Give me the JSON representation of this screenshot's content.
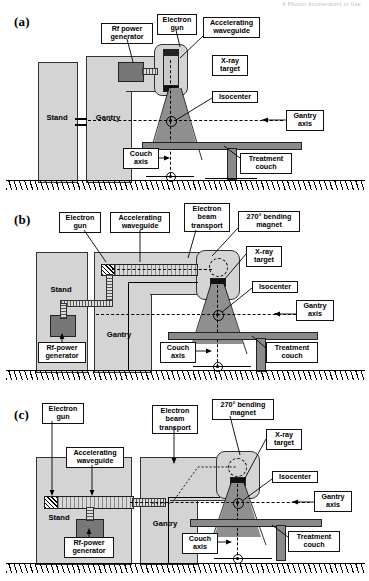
{
  "figure": {
    "type": "technical-diagram",
    "panel_count": 3,
    "header_faint_text": "4  Photon Accelerators in Use"
  },
  "panels": [
    {
      "id": "a",
      "label": "(a)",
      "description": "Straight-through beam linac: short accelerating waveguide mounted vertically in the gantry head, x-ray target at waveguide exit, no bending magnet.",
      "callouts": [
        {
          "name": "rf-power-generator",
          "text": "Rf power\ngenerator"
        },
        {
          "name": "electron-gun",
          "text": "Electron\ngun"
        },
        {
          "name": "accelerating-waveguide",
          "text": "Accelerating\nwaveguide"
        },
        {
          "name": "x-ray-target",
          "text": "X-ray\ntarget"
        },
        {
          "name": "isocenter",
          "text": "Isocenter"
        },
        {
          "name": "gantry-axis",
          "text": "Gantry\naxis"
        },
        {
          "name": "couch-axis",
          "text": "Couch\naxis"
        },
        {
          "name": "treatment-couch",
          "text": "Treatment\ncouch"
        }
      ],
      "body_labels": [
        {
          "name": "stand",
          "text": "Stand"
        },
        {
          "name": "gantry",
          "text": "Gantry"
        }
      ]
    },
    {
      "id": "b",
      "label": "(b)",
      "description": "Horizontal accelerating waveguide in the gantry with 270 degree bending magnet directing the electron beam onto the x-ray target; rf-power generator in the stand.",
      "callouts": [
        {
          "name": "electron-gun",
          "text": "Electron\ngun"
        },
        {
          "name": "accelerating-waveguide",
          "text": "Accelerating\nwaveguide"
        },
        {
          "name": "electron-beam-transport",
          "text": "Electron\nbeam\ntransport"
        },
        {
          "name": "bending-magnet",
          "text": "270° bending\nmagnet"
        },
        {
          "name": "x-ray-target",
          "text": "X-ray\ntarget"
        },
        {
          "name": "isocenter",
          "text": "Isocenter"
        },
        {
          "name": "gantry-axis",
          "text": "Gantry\naxis"
        },
        {
          "name": "couch-axis",
          "text": "Couch\naxis"
        },
        {
          "name": "treatment-couch",
          "text": "Treatment\ncouch"
        },
        {
          "name": "rf-power-generator",
          "text": "Rf-power\ngenerator"
        }
      ],
      "body_labels": [
        {
          "name": "stand",
          "text": "Stand"
        },
        {
          "name": "gantry",
          "text": "Gantry"
        }
      ]
    },
    {
      "id": "c",
      "label": "(c)",
      "description": "Long accelerating waveguide mounted horizontally in the stand, electron beam transport carries beam into the gantry to a 270 degree bending magnet and the x-ray target.",
      "callouts": [
        {
          "name": "electron-gun",
          "text": "Electron\ngun"
        },
        {
          "name": "accelerating-waveguide",
          "text": "Accelerating\nwaveguide"
        },
        {
          "name": "electron-beam-transport",
          "text": "Electron\nbeam\ntransport"
        },
        {
          "name": "bending-magnet",
          "text": "270° bending\nmagnet"
        },
        {
          "name": "x-ray-target",
          "text": "X-ray\ntarget"
        },
        {
          "name": "isocenter",
          "text": "Isocenter"
        },
        {
          "name": "gantry-axis",
          "text": "Gantry\naxis"
        },
        {
          "name": "couch-axis",
          "text": "Couch\naxis"
        },
        {
          "name": "treatment-couch",
          "text": "Treatment\ncouch"
        },
        {
          "name": "rf-power-generator",
          "text": "Rf-power\ngenerator"
        }
      ],
      "body_labels": [
        {
          "name": "stand",
          "text": "Stand"
        },
        {
          "name": "gantry",
          "text": "Gantry"
        }
      ]
    }
  ],
  "colors": {
    "body_fill": "#d4d4d4",
    "beam_fill": "#8f8f8f",
    "solid_component": "#777777",
    "couch": "#8a8a8a",
    "line": "#000000",
    "page_bg": "#ffffff"
  }
}
